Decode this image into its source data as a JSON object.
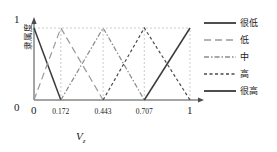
{
  "chart_data": {
    "type": "line",
    "title": "",
    "xlabel": "V_z",
    "ylabel": "隶属度",
    "xlim": [
      0,
      1
    ],
    "ylim": [
      0,
      1
    ],
    "grid": true,
    "grid_style": "dashed vertical at each breakpoint plus horizontal at y=1",
    "legend_position": "right",
    "x_ticks": [
      {
        "value": 0,
        "label": "0"
      },
      {
        "value": 0.172,
        "label": "0.172"
      },
      {
        "value": 0.443,
        "label": "0.443"
      },
      {
        "value": 0.707,
        "label": "0.707"
      },
      {
        "value": 1,
        "label": "1"
      }
    ],
    "y_ticks": [
      {
        "value": 0,
        "label": "0"
      },
      {
        "value": 1,
        "label": "1"
      }
    ],
    "breakpoints": [
      0,
      0.172,
      0.443,
      0.707,
      1
    ],
    "series": [
      {
        "name": "很低",
        "style": "solid",
        "color": "#3a3a3a",
        "points": [
          [
            0,
            1
          ],
          [
            0.172,
            0
          ]
        ]
      },
      {
        "name": "低",
        "style": "long-dash",
        "color": "#9a9a9a",
        "points": [
          [
            0,
            0
          ],
          [
            0.172,
            1
          ],
          [
            0.443,
            0
          ]
        ]
      },
      {
        "name": "中",
        "style": "dash-dot",
        "color": "#8a8a8a",
        "points": [
          [
            0.172,
            0
          ],
          [
            0.443,
            1
          ],
          [
            0.707,
            0
          ]
        ]
      },
      {
        "name": "高",
        "style": "short-dash",
        "color": "#4a4a4a",
        "points": [
          [
            0.443,
            0
          ],
          [
            0.707,
            1
          ],
          [
            1,
            0
          ]
        ]
      },
      {
        "name": "很高",
        "style": "solid",
        "color": "#3a3a3a",
        "points": [
          [
            0.707,
            0
          ],
          [
            1,
            1
          ]
        ]
      }
    ]
  },
  "axes": {
    "y_label": "隶属度",
    "y_tick_top": "1",
    "y_tick_bottom": "0",
    "x_title_base": "V",
    "x_title_sub": "z",
    "x_tick_0": "0",
    "x_tick_1": "0.172",
    "x_tick_2": "0.443",
    "x_tick_3": "0.707",
    "x_tick_4": "1"
  },
  "legend": {
    "items": [
      {
        "label": "很低",
        "style": "solid"
      },
      {
        "label": "低",
        "style": "long-dash"
      },
      {
        "label": "中",
        "style": "dash-dot"
      },
      {
        "label": "高",
        "style": "short-dash"
      },
      {
        "label": "很高",
        "style": "solid"
      }
    ]
  },
  "colors": {
    "axis": "#4a4a4a",
    "grid": "#b5b5b5",
    "text": "#1a1a1a",
    "line_dark": "#3a3a3a",
    "line_mid": "#8a8a8a",
    "line_light": "#9a9a9a"
  }
}
